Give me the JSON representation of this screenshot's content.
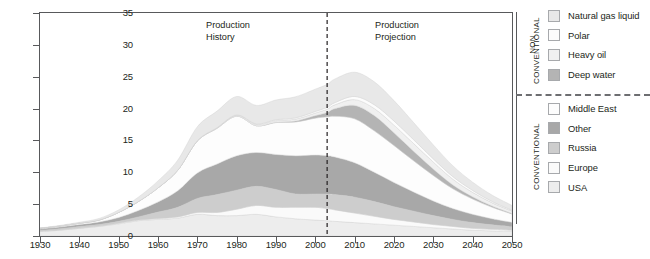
{
  "figure": {
    "annotations": [
      {
        "name": "production-history",
        "line1": "Production",
        "line2": "History"
      },
      {
        "name": "production-projection",
        "line1": "Production",
        "line2": "Projection"
      }
    ]
  },
  "legend": {
    "groups": [
      {
        "name": "non-conventional",
        "title_line1": "NON",
        "title_line2": "CONVENTIONAL",
        "items": [
          {
            "label": "Natural gas liquid",
            "color": "#e8e8e8"
          },
          {
            "label": "Polar",
            "color": "#fcfcfc"
          },
          {
            "label": "Heavy oil",
            "color": "#f0f0f0"
          },
          {
            "label": "Deep water",
            "color": "#b4b4b4"
          }
        ]
      },
      {
        "name": "conventional",
        "title_line1": "",
        "title_line2": "CONVENTIONAL",
        "items": [
          {
            "label": "Middle East",
            "color": "#fdfdfd"
          },
          {
            "label": "Other",
            "color": "#a8a8a8"
          },
          {
            "label": "Russia",
            "color": "#cdcdcd"
          },
          {
            "label": "Europe",
            "color": "#fafafa"
          },
          {
            "label": "USA",
            "color": "#ededed"
          }
        ]
      }
    ]
  },
  "chart_data": {
    "type": "area",
    "title": "",
    "xlabel": "",
    "ylabel": "Billion barrels per year",
    "xlim": [
      1930,
      2050
    ],
    "ylim": [
      0,
      35
    ],
    "xticks": [
      1930,
      1940,
      1950,
      1960,
      1970,
      1980,
      1990,
      2000,
      2010,
      2020,
      2030,
      2040,
      2050
    ],
    "yticks": [
      0,
      5,
      10,
      15,
      20,
      25,
      30,
      35
    ],
    "grid": false,
    "legend_position": "right",
    "stacked": true,
    "divider_x": 2003,
    "divider_style": "dashed",
    "x": [
      1930,
      1935,
      1940,
      1945,
      1950,
      1955,
      1960,
      1965,
      1970,
      1975,
      1980,
      1985,
      1990,
      1995,
      2000,
      2003,
      2005,
      2010,
      2015,
      2020,
      2025,
      2030,
      2035,
      2040,
      2045,
      2050
    ],
    "series": [
      {
        "name": "USA",
        "values": [
          0.7,
          0.9,
          1.2,
          1.5,
          1.9,
          2.4,
          2.6,
          2.8,
          3.4,
          3.2,
          3.2,
          3.4,
          3.0,
          2.7,
          2.5,
          2.4,
          2.3,
          2.1,
          1.9,
          1.7,
          1.5,
          1.3,
          1.1,
          0.9,
          0.8,
          0.7
        ]
      },
      {
        "name": "Europe",
        "values": [
          0.05,
          0.05,
          0.05,
          0.05,
          0.1,
          0.1,
          0.15,
          0.2,
          0.3,
          0.5,
          1.0,
          1.4,
          1.5,
          1.8,
          2.0,
          1.9,
          1.8,
          1.5,
          1.2,
          0.9,
          0.7,
          0.5,
          0.4,
          0.3,
          0.25,
          0.2
        ]
      },
      {
        "name": "Russia",
        "values": [
          0.15,
          0.2,
          0.25,
          0.25,
          0.3,
          0.5,
          1.0,
          1.5,
          2.2,
          2.8,
          3.0,
          3.0,
          2.8,
          2.1,
          2.1,
          2.3,
          2.4,
          2.5,
          2.3,
          2.0,
          1.7,
          1.4,
          1.1,
          0.9,
          0.7,
          0.55
        ]
      },
      {
        "name": "Other",
        "values": [
          0.2,
          0.25,
          0.3,
          0.4,
          0.6,
          1.0,
          1.6,
          2.6,
          4.0,
          4.8,
          5.4,
          5.3,
          5.5,
          6.0,
          6.1,
          6.0,
          5.9,
          5.4,
          4.6,
          3.8,
          3.0,
          2.3,
          1.7,
          1.3,
          0.95,
          0.7
        ]
      },
      {
        "name": "Middle East",
        "values": [
          0.1,
          0.15,
          0.2,
          0.3,
          0.8,
          1.4,
          2.2,
          3.2,
          5.0,
          5.6,
          6.2,
          4.2,
          5.0,
          5.3,
          5.8,
          6.1,
          6.4,
          6.9,
          6.5,
          5.8,
          4.9,
          4.0,
          3.1,
          2.4,
          1.8,
          1.3
        ]
      },
      {
        "name": "Deep water",
        "values": [
          0,
          0,
          0,
          0,
          0,
          0,
          0,
          0,
          0,
          0,
          0,
          0,
          0.05,
          0.15,
          0.4,
          0.7,
          1.2,
          2.1,
          2.4,
          2.0,
          1.5,
          1.0,
          0.6,
          0.35,
          0.2,
          0.1
        ]
      },
      {
        "name": "Heavy oil",
        "values": [
          0,
          0,
          0,
          0,
          0,
          0,
          0,
          0,
          0.05,
          0.1,
          0.15,
          0.2,
          0.25,
          0.3,
          0.4,
          0.5,
          0.6,
          0.9,
          1.1,
          1.2,
          1.2,
          1.1,
          0.9,
          0.7,
          0.5,
          0.35
        ]
      },
      {
        "name": "Polar",
        "values": [
          0,
          0,
          0,
          0,
          0,
          0,
          0,
          0,
          0,
          0,
          0.05,
          0.1,
          0.15,
          0.2,
          0.25,
          0.3,
          0.35,
          0.5,
          0.6,
          0.65,
          0.6,
          0.5,
          0.4,
          0.3,
          0.2,
          0.15
        ]
      },
      {
        "name": "Natural gas liquid",
        "values": [
          0.05,
          0.1,
          0.15,
          0.25,
          0.4,
          0.7,
          1.1,
          1.6,
          2.2,
          2.6,
          2.9,
          2.9,
          3.1,
          3.3,
          3.5,
          3.6,
          3.7,
          3.8,
          3.6,
          3.2,
          2.7,
          2.2,
          1.7,
          1.3,
          1.0,
          0.75
        ]
      }
    ]
  }
}
